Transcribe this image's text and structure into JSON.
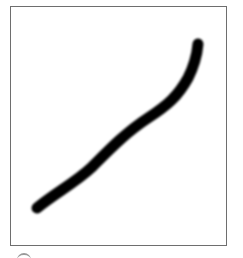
{
  "canvas": {
    "background_color": "#ffffff",
    "border_color": "#6e6e6e",
    "frame": {
      "left": 10,
      "top": 6,
      "right": 227,
      "bottom": 246
    }
  },
  "stroke": {
    "color": "#000000",
    "width": 11,
    "blur": 1.2,
    "path": "M37,208 C55,193 75,183 92,167 C108,151 125,133 148,118 C168,105 178,96 188,78 C194,66 197,55 198,44"
  },
  "bottom_indicator": {
    "color": "#9a9a9a"
  }
}
